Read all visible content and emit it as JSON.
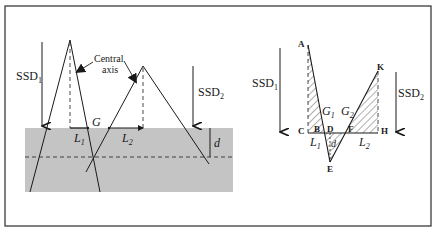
{
  "left_panel": {
    "ssd1": {
      "main": "SSD",
      "sub": "1"
    },
    "ssd2": {
      "main": "SSD",
      "sub": "2"
    },
    "central_axis_line1": "Central",
    "central_axis_line2": "axis",
    "gap": "G",
    "l1": {
      "main": "L",
      "sub": "1"
    },
    "l2": {
      "main": "L",
      "sub": "2"
    },
    "depth": "d"
  },
  "right_panel": {
    "ssd1": {
      "main": "SSD",
      "sub": "1"
    },
    "ssd2": {
      "main": "SSD",
      "sub": "2"
    },
    "points": {
      "A": "A",
      "B": "B",
      "C": "C",
      "D": "D",
      "E": "E",
      "F": "F",
      "H": "H",
      "K": "K"
    },
    "g1": {
      "main": "G",
      "sub": "1"
    },
    "g2": {
      "main": "G",
      "sub": "2"
    },
    "l1": {
      "main": "L",
      "sub": "1"
    },
    "l2": {
      "main": "L",
      "sub": "2"
    },
    "depth": "d"
  },
  "colors": {
    "phantom": "#c4c4c4",
    "line": "#1a1a1a",
    "frame": "#2a2a2a"
  }
}
